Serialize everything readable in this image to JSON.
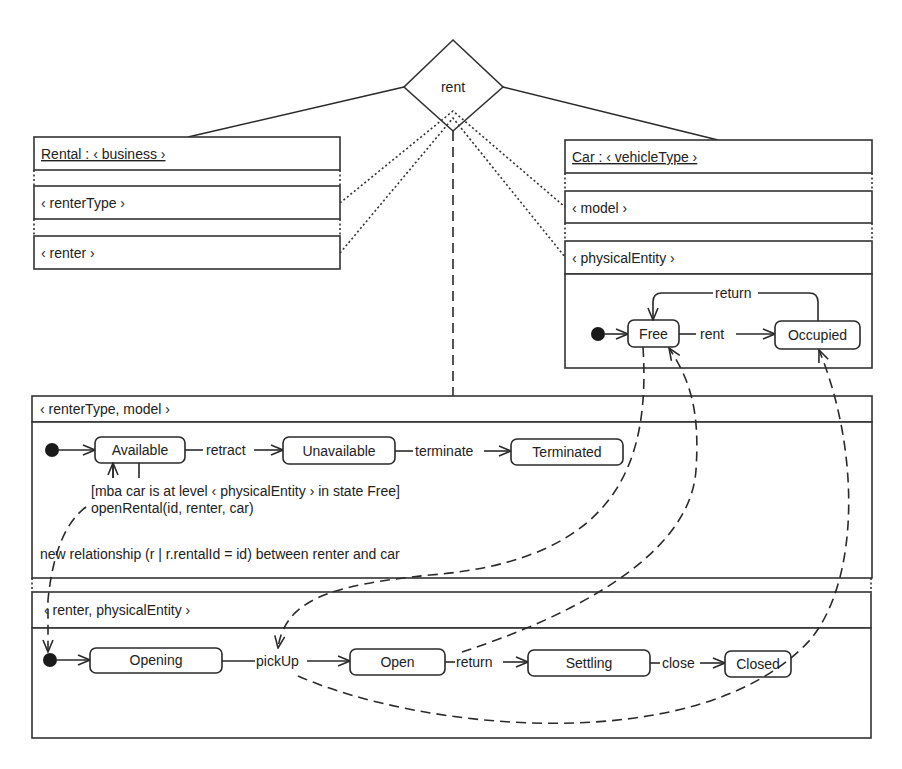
{
  "relationship": {
    "label": "rent"
  },
  "rental": {
    "title": "Rental : ‹ business ›",
    "levels": [
      "‹ renterType ›",
      "‹ renter ›"
    ]
  },
  "car": {
    "title": "Car : ‹ vehicleType ›",
    "levels": [
      "‹ model ›",
      "‹ physicalEntity ›"
    ],
    "states": [
      "Free",
      "Occupied"
    ],
    "transitions": {
      "rent": "rent",
      "return": "return"
    }
  },
  "relationship_levels": {
    "top": {
      "header": "‹ renterType, model ›",
      "states": [
        "Available",
        "Unavailable",
        "Terminated"
      ],
      "transitions": {
        "retract": "retract",
        "terminate": "terminate"
      },
      "guard": "[mba car is at level ‹ physicalEntity › in state Free]",
      "action": "openRental(id, renter, car)",
      "effect": "new relationship (r | r.rentalId = id) between renter and car"
    },
    "bottom": {
      "header": "‹ renter, physicalEntity ›",
      "states": [
        "Opening",
        "Open",
        "Settling",
        "Closed"
      ],
      "transitions": {
        "pickUp": "pickUp",
        "return": "return",
        "close": "close"
      }
    }
  }
}
